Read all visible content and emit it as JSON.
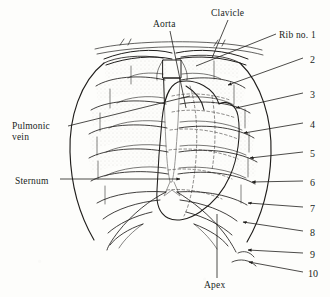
{
  "figure": {
    "background_color": "#fdfdfb",
    "ink_color": "#201e1c",
    "style": "pen-and-ink line drawing, stippled shading"
  },
  "labels": [
    {
      "id": "aorta",
      "text": "Aorta",
      "x": 168,
      "y": 25,
      "anchor": "middle"
    },
    {
      "id": "clavicle",
      "text": "Clavicle",
      "x": 232,
      "y": 14,
      "anchor": "middle"
    },
    {
      "id": "rib-no-1",
      "text": "Rib no. 1",
      "x": 279,
      "y": 36,
      "anchor": "start"
    },
    {
      "id": "pulmonic-vein",
      "text": "Pulmonic",
      "x": 12,
      "y": 127,
      "anchor": "start"
    },
    {
      "id": "pulmonic-vein-2",
      "text": "vein",
      "x": 12,
      "y": 138,
      "anchor": "start"
    },
    {
      "id": "sternum",
      "text": "Sternum",
      "x": 15,
      "y": 182,
      "anchor": "start"
    },
    {
      "id": "apex",
      "text": "Apex",
      "x": 217,
      "y": 286,
      "anchor": "middle"
    }
  ],
  "rib_numbers": [
    {
      "text": "2",
      "x": 310,
      "y": 61
    },
    {
      "text": "3",
      "x": 310,
      "y": 96
    },
    {
      "text": "4",
      "x": 310,
      "y": 126
    },
    {
      "text": "5",
      "x": 310,
      "y": 155
    },
    {
      "text": "6",
      "x": 310,
      "y": 184
    },
    {
      "text": "7",
      "x": 310,
      "y": 210
    },
    {
      "text": "8",
      "x": 310,
      "y": 234
    },
    {
      "text": "9",
      "x": 310,
      "y": 256
    },
    {
      "text": "10",
      "x": 310,
      "y": 275
    }
  ]
}
